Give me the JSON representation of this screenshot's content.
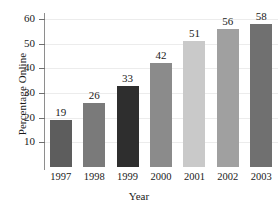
{
  "chart_data": {
    "type": "bar",
    "title": "",
    "xlabel": "Year",
    "ylabel": "Percentage Online",
    "categories": [
      "1997",
      "1998",
      "1999",
      "2000",
      "2001",
      "2002",
      "2003"
    ],
    "values": [
      19,
      26,
      33,
      42,
      51,
      56,
      58
    ],
    "value_labels": [
      "19",
      "26",
      "33",
      "42",
      "51",
      "56",
      "58"
    ],
    "ylim": [
      0,
      62
    ],
    "yticks": [
      10,
      20,
      30,
      40,
      50,
      60
    ],
    "ytick_labels": [
      "10",
      "20",
      "30",
      "40",
      "50",
      "60"
    ],
    "grid": "horizontal",
    "legend": "none",
    "bar_colors": [
      "#5d5d5d",
      "#7a7a7a",
      "#2e2e2e",
      "#8b8b8b",
      "#c9c9c9",
      "#a0a0a0",
      "#707070"
    ],
    "gridline_color": "#ececec",
    "axis_color": "#8e8e8e",
    "text_color": "#1a1a1a",
    "background": "#ffffff"
  }
}
